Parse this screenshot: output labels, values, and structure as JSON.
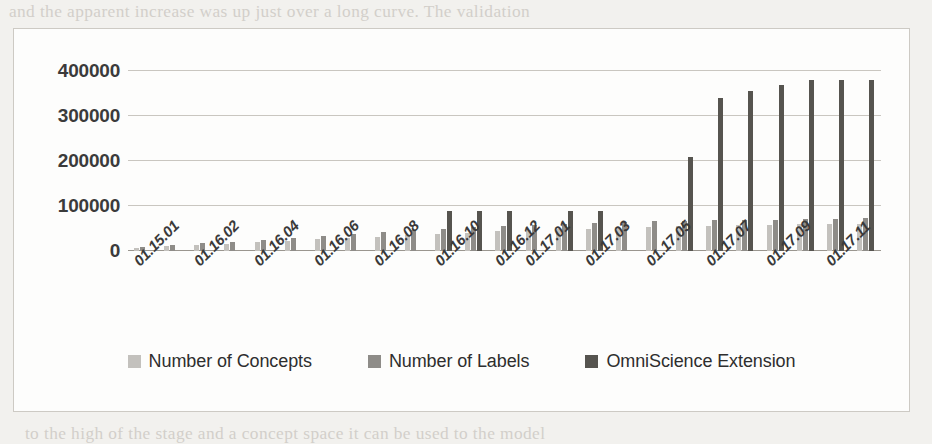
{
  "page": {
    "background_texture_lines": [
      {
        "text": "and the apparent increase was up just over a long curve. The validation",
        "x": 14,
        "y": 2
      },
      {
        "text": "a relation between them in a space so that we then see a time period for the",
        "x": 30,
        "y": 36
      },
      {
        "text": "single and it is impossible to carry out a consistently satisfactory trend of a monthly increase,",
        "x": 24,
        "y": 62
      },
      {
        "text": "for the expansion of the concept space was created to 100,000, in the same period",
        "x": 26,
        "y": 90
      },
      {
        "text": "corresponding to the notably expanding. It is clear to figure that the scale in",
        "x": 24,
        "y": 116
      },
      {
        "text": "the model of the manual annotation was maintained to finally reviewed set of",
        "x": 22,
        "y": 143
      },
      {
        "text": "the collection concepts for the prior and the OmniScience Extension",
        "x": 30,
        "y": 170
      },
      {
        "text": "revision",
        "x": 240,
        "y": 196
      },
      {
        "text": "1.3.2.",
        "x": 200,
        "y": 240
      },
      {
        "text": "0.1 We will be the second",
        "x": 120,
        "y": 300
      },
      {
        "text": "to the high of the stage and a concept space it can be used to the model",
        "x": 30,
        "y": 424
      }
    ]
  },
  "chart_data": {
    "type": "bar",
    "title": "",
    "xlabel": "",
    "ylabel": "",
    "ylim": [
      0,
      400000
    ],
    "yticks": [
      0,
      100000,
      200000,
      300000,
      400000
    ],
    "ytick_labels": [
      "0",
      "100000",
      "200000",
      "300000",
      "400000"
    ],
    "grid": true,
    "legend_position": "bottom",
    "categories": [
      "01.15.01",
      "01.16.01",
      "01.16.02",
      "01.16.03",
      "01.16.04",
      "01.16.05",
      "01.16.06",
      "01.16.07",
      "01.16.08",
      "01.16.09",
      "01.16.10",
      "01.16.11",
      "01.16.12",
      "01.17.01",
      "01.17.02",
      "01.17.03",
      "01.17.04",
      "01.17.05",
      "01.17.06",
      "01.17.07",
      "01.17.08",
      "01.17.09",
      "01.17.10",
      "01.17.11",
      "01.17.12"
    ],
    "visible_tick_labels": [
      "01.15.01",
      "01.16.02",
      "01.16.04",
      "01.16.06",
      "01.16.08",
      "01.16.10",
      "01.16.12",
      "01.17.01",
      "01.17.03",
      "01.17.05",
      "01.17.07",
      "01.17.09",
      "01.17.11"
    ],
    "visible_tick_indices": [
      0,
      2,
      4,
      6,
      8,
      10,
      12,
      13,
      15,
      17,
      19,
      21,
      23
    ],
    "series": [
      {
        "name": "Number of Concepts",
        "color": "#c3c1bd",
        "values": [
          6000,
          11000,
          13000,
          16000,
          19000,
          23000,
          26000,
          29000,
          32000,
          35000,
          38000,
          41000,
          44000,
          46000,
          48000,
          50000,
          52000,
          54000,
          55000,
          56000,
          57000,
          58000,
          59000,
          60000,
          61000
        ]
      },
      {
        "name": "Number of Labels",
        "color": "#8e8c88",
        "values": [
          8000,
          14000,
          17000,
          21000,
          25000,
          30000,
          34000,
          38000,
          42000,
          46000,
          50000,
          53000,
          56000,
          58000,
          60000,
          62000,
          64000,
          66000,
          67000,
          68000,
          69000,
          70000,
          71000,
          72000,
          73000
        ]
      },
      {
        "name": "OmniScience Extension",
        "color": "#56544f",
        "values": [
          0,
          0,
          0,
          0,
          0,
          0,
          0,
          0,
          0,
          0,
          90000,
          90000,
          90000,
          0,
          90000,
          90000,
          0,
          0,
          210000,
          340000,
          355000,
          370000,
          380000,
          380000,
          380000
        ]
      }
    ]
  },
  "legend": {
    "items": [
      {
        "label": "Number of Concepts",
        "swatch": "s0"
      },
      {
        "label": "Number of Labels",
        "swatch": "s1"
      },
      {
        "label": "OmniScience Extension",
        "swatch": "s2"
      }
    ]
  }
}
